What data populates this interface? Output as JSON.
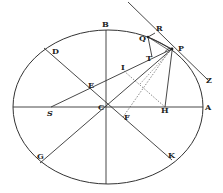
{
  "figure": {
    "type": "geometry-diagram",
    "stroke_color": "#333333",
    "background": "#ffffff"
  },
  "ellipse": {
    "cx": 108,
    "cy": 107,
    "rx": 95,
    "ry": 77
  },
  "points": {
    "A": {
      "label": "A",
      "x": 203,
      "y": 107
    },
    "B": {
      "label": "B",
      "x": 106,
      "y": 30
    },
    "C": {
      "label": "C",
      "x": 104,
      "y": 107
    },
    "D": {
      "label": "D",
      "x": 46,
      "y": 49
    },
    "E": {
      "label": "E",
      "x": 88,
      "y": 87
    },
    "F": {
      "label": "F",
      "x": 123,
      "y": 115
    },
    "G": {
      "label": "G",
      "x": 40,
      "y": 160
    },
    "H": {
      "label": "H",
      "x": 165,
      "y": 107
    },
    "I": {
      "label": "I",
      "x": 124,
      "y": 71
    },
    "K": {
      "label": "K",
      "x": 170,
      "y": 158
    },
    "P": {
      "label": "P",
      "x": 172,
      "y": 49
    },
    "Q": {
      "label": "Q",
      "x": 148,
      "y": 37
    },
    "R": {
      "label": "R",
      "x": 155,
      "y": 31
    },
    "S": {
      "label": "S",
      "x": 51,
      "y": 107
    },
    "T": {
      "label": "T",
      "x": 152,
      "y": 57
    },
    "Z": {
      "label": "Z",
      "x": 205,
      "y": 80
    }
  },
  "segments": [
    {
      "name": "major-axis",
      "from": "left-vertex",
      "to": "A",
      "style": "solid"
    },
    {
      "name": "minor-axis",
      "from": "B",
      "to": "bottom-vertex",
      "style": "solid"
    },
    {
      "name": "diameter-DK",
      "from": "D",
      "to": "K",
      "style": "solid"
    },
    {
      "name": "diameter-PG",
      "from": "P",
      "to": "G",
      "style": "solid"
    },
    {
      "name": "focal-radius-SP",
      "from": "S",
      "to": "P",
      "style": "solid"
    },
    {
      "name": "focal-radius-HP",
      "from": "H",
      "to": "P",
      "style": "solid"
    },
    {
      "name": "tangent-RPZ",
      "from": "tangent-start",
      "to": "Z",
      "style": "solid"
    },
    {
      "name": "segment-QR",
      "from": "Q",
      "to": "R",
      "style": "solid"
    },
    {
      "name": "segment-QT",
      "from": "Q",
      "to": "T",
      "style": "solid"
    },
    {
      "name": "segment-QP",
      "from": "Q",
      "to": "P",
      "style": "solid"
    },
    {
      "name": "segment-TP",
      "from": "T",
      "to": "P",
      "style": "solid"
    },
    {
      "name": "segment-IH",
      "from": "I",
      "to": "H",
      "style": "dotted"
    },
    {
      "name": "segment-FP",
      "from": "F",
      "to": "P",
      "style": "dotted"
    }
  ]
}
